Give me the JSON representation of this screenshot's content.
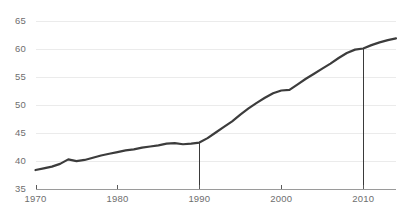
{
  "chart_data": {
    "type": "line",
    "title": "",
    "subtitle": "",
    "xlabel": "",
    "ylabel": "",
    "xlim": [
      1970,
      2014
    ],
    "ylim": [
      35,
      65
    ],
    "grid": true,
    "legend": false,
    "legend_position": "none",
    "line_color": "#3c3c3c",
    "grid_color": "#ebebeb",
    "axis_color": "#9a9a9a",
    "tick_label_color": "#6e6e6e",
    "background_color": "#ffffff",
    "y_ticks": [
      35,
      40,
      45,
      50,
      55,
      60,
      65
    ],
    "y_tick_labels": [
      "35",
      "40",
      "45",
      "50",
      "55",
      "60",
      "65"
    ],
    "x_ticks": [
      1970,
      1980,
      1990,
      2000,
      2010
    ],
    "x_tick_labels": [
      "1970",
      "1980",
      "1990",
      "2000",
      "2010"
    ],
    "annotations": [
      {
        "name": "marker-1990",
        "x": 1990,
        "y_top": 43.2,
        "y_bottom": 35,
        "label": ""
      },
      {
        "name": "marker-2010",
        "x": 2010,
        "y_top": 60.0,
        "y_bottom": 35,
        "label": ""
      }
    ],
    "series": [
      {
        "name": "series-1",
        "color": "#3c3c3c",
        "x": [
          1970,
          1971,
          1972,
          1973,
          1974,
          1975,
          1976,
          1977,
          1978,
          1979,
          1980,
          1981,
          1982,
          1983,
          1984,
          1985,
          1986,
          1987,
          1988,
          1989,
          1990,
          1991,
          1992,
          1993,
          1994,
          1995,
          1996,
          1997,
          1998,
          1999,
          2000,
          2001,
          2002,
          2003,
          2004,
          2005,
          2006,
          2007,
          2008,
          2009,
          2010,
          2011,
          2012,
          2013,
          2014
        ],
        "values": [
          38.3,
          38.6,
          38.9,
          39.4,
          40.2,
          39.9,
          40.1,
          40.5,
          40.9,
          41.2,
          41.5,
          41.8,
          42.0,
          42.3,
          42.5,
          42.7,
          43.0,
          43.1,
          42.9,
          43.0,
          43.2,
          44.0,
          45.0,
          46.0,
          47.0,
          48.2,
          49.3,
          50.3,
          51.2,
          52.0,
          52.5,
          52.6,
          53.6,
          54.6,
          55.5,
          56.4,
          57.3,
          58.3,
          59.2,
          59.8,
          60.0,
          60.6,
          61.1,
          61.5,
          61.8
        ]
      }
    ]
  }
}
